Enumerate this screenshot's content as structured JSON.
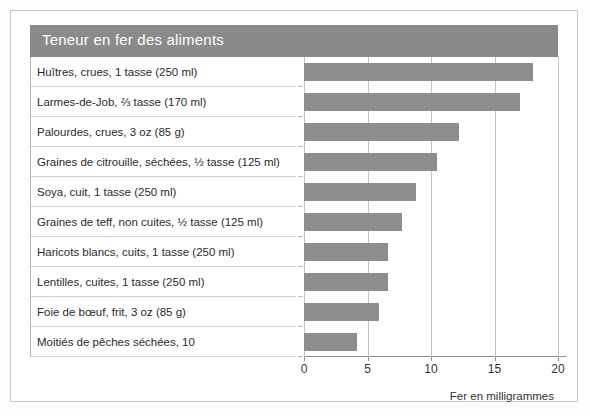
{
  "title": "Teneur en fer des aliments",
  "axis": {
    "xlabel": "Fer en milligrammes",
    "ticks": [
      "0",
      "5",
      "10",
      "15",
      "20"
    ]
  },
  "chart_data": {
    "type": "bar",
    "orientation": "horizontal",
    "title": "Teneur en fer des aliments",
    "xlabel": "Fer en milligrammes",
    "ylabel": "",
    "xlim": [
      0,
      20
    ],
    "xticks": [
      0,
      5,
      10,
      15,
      20
    ],
    "grid": true,
    "legend": "none",
    "bar_color": "#8d8d8d",
    "categories": [
      "Huîtres, crues, 1 tasse (250 ml)",
      "Larmes-de-Job, ⅔ tasse (170 ml)",
      "Palourdes, crues, 3 oz (85 g)",
      "Graines de citrouille, séchées, ½ tasse (125 ml)",
      "Soya, cuit, 1 tasse (250 ml)",
      "Graines de teff, non cuites, ½ tasse (125 ml)",
      "Haricots blancs, cuits, 1 tasse (250 ml)",
      "Lentilles, cuites, 1 tasse (250 ml)",
      "Foie de bœuf, frit, 3 oz (85 g)",
      "Moitiés de pêches séchées, 10"
    ],
    "values": [
      18.0,
      17.0,
      12.2,
      10.5,
      8.8,
      7.7,
      6.6,
      6.6,
      5.9,
      4.2
    ]
  }
}
